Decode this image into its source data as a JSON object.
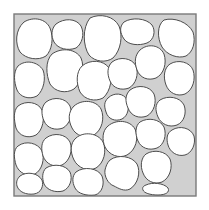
{
  "figure": {
    "type": "cell-packing-diagram",
    "colors": {
      "background": "#ffffff",
      "matrix_fill": "#d0d0d0",
      "frame_stroke": "#7a7a7a",
      "cell_fill": "#ffffff",
      "cell_stroke": "#4d4d4d"
    },
    "frame": {
      "x": 14,
      "y": 14,
      "width": 182,
      "height": 182
    },
    "cell_count": 30,
    "cells": [
      {
        "id": "c1",
        "d": "M24,22 C34,16 46,19 50,28 C54,38 52,50 46,56 C38,61 26,59 20,52 C15,44 15,30 24,22 Z"
      },
      {
        "id": "c2",
        "d": "M56,24 C64,18 76,18 81,26 C85,34 82,44 76,48 C68,51 58,49 54,42 C51,36 51,29 56,24 Z"
      },
      {
        "id": "c3",
        "d": "M90,18 C100,13 114,16 119,26 C123,36 121,50 113,58 C106,63 95,62 89,55 C83,46 82,28 90,18 Z"
      },
      {
        "id": "c4",
        "d": "M124,22 C132,17 146,18 152,25 C156,31 154,40 147,43 C139,46 128,45 124,39 C120,33 119,27 124,22 Z"
      },
      {
        "id": "c5",
        "d": "M164,20 C174,17 188,22 193,32 C196,42 193,52 186,56 C178,59 167,55 162,47 C157,38 157,25 164,20 Z"
      },
      {
        "id": "c6",
        "d": "M18,66 C26,59 38,62 43,70 C46,78 44,90 37,96 C29,100 20,97 17,90 C14,82 13,72 18,66 Z"
      },
      {
        "id": "c7",
        "d": "M52,54 C62,47 76,49 81,58 C85,67 82,82 74,89 C66,94 55,92 50,84 C46,75 45,61 52,54 Z"
      },
      {
        "id": "c8",
        "d": "M82,66 C90,59 104,60 109,68 C113,77 111,91 103,98 C95,102 85,100 80,92 C76,83 76,72 82,66 Z"
      },
      {
        "id": "c9",
        "d": "M112,62 C120,56 132,58 136,66 C139,74 136,84 129,88 C121,91 113,88 110,81 C107,74 107,67 112,62 Z"
      },
      {
        "id": "c10",
        "d": "M140,50 C148,43 160,45 164,54 C167,63 164,74 156,78 C148,81 140,78 137,70 C134,62 135,55 140,50 Z"
      },
      {
        "id": "c11",
        "d": "M170,64 C178,59 190,62 193,70 C196,79 193,90 185,94 C177,97 169,93 166,85 C163,77 164,68 170,64 Z"
      },
      {
        "id": "c12",
        "d": "M18,106 C26,100 38,102 42,110 C45,118 43,130 36,135 C28,139 19,136 16,128 C14,120 13,111 18,106 Z"
      },
      {
        "id": "c13",
        "d": "M46,102 C54,96 66,98 70,106 C73,114 70,124 63,128 C55,131 47,128 44,121 C41,114 41,107 46,102 Z"
      },
      {
        "id": "c14",
        "d": "M74,106 C82,99 96,100 101,109 C105,118 102,130 94,135 C86,139 76,136 72,128 C68,120 68,112 74,106 Z"
      },
      {
        "id": "c15",
        "d": "M108,98 C114,92 124,93 127,100 C130,107 128,116 122,119 C115,122 108,119 106,112 C104,106 104,102 108,98 Z"
      },
      {
        "id": "c16",
        "d": "M130,90 C138,84 150,86 154,94 C157,102 154,112 147,116 C139,119 131,116 128,108 C125,101 125,95 130,90 Z"
      },
      {
        "id": "c17",
        "d": "M160,100 C168,95 180,97 184,105 C187,113 184,122 177,125 C169,128 161,124 158,117 C155,110 155,104 160,100 Z"
      },
      {
        "id": "c18",
        "d": "M172,130 C180,125 191,128 194,136 C196,144 192,153 185,155 C177,157 170,152 168,145 C166,138 167,133 172,130 Z"
      },
      {
        "id": "c19",
        "d": "M18,146 C26,140 38,143 42,151 C45,159 42,170 35,174 C27,177 19,173 16,165 C14,158 13,150 18,146 Z"
      },
      {
        "id": "c20",
        "d": "M46,138 C54,132 66,134 70,142 C73,150 70,161 62,165 C54,168 46,164 43,156 C41,149 41,142 46,138 Z"
      },
      {
        "id": "c21",
        "d": "M76,138 C84,131 98,133 103,142 C107,151 104,163 96,168 C88,172 78,168 74,160 C70,152 70,143 76,138 Z"
      },
      {
        "id": "c22",
        "d": "M108,126 C116,119 130,120 135,129 C139,138 136,150 127,155 C119,159 109,155 105,147 C102,140 102,131 108,126 Z"
      },
      {
        "id": "c23",
        "d": "M140,122 C148,117 160,119 164,127 C167,135 164,145 157,148 C149,151 141,148 138,141 C135,134 135,126 140,122 Z"
      },
      {
        "id": "c24",
        "d": "M20,176 C27,171 38,173 42,180 C44,186 41,193 34,194 C26,195 19,192 17,186 C16,182 17,179 20,176 Z"
      },
      {
        "id": "c25",
        "d": "M46,168 C54,163 66,165 70,172 C73,179 70,188 63,191 C55,193 47,190 44,184 C42,178 42,172 46,168 Z"
      },
      {
        "id": "c26",
        "d": "M76,172 C84,166 98,168 102,176 C105,184 102,193 95,195 C87,196 78,194 75,188 C72,182 72,176 76,172 Z"
      },
      {
        "id": "c27",
        "d": "M110,160 C118,154 132,156 137,164 C141,172 138,184 130,189 C124,192 118,188 114,186 C108,184 104,176 105,170 C106,166 107,163 110,160 Z"
      },
      {
        "id": "c28",
        "d": "M146,154 C154,149 166,151 170,159 C173,167 170,178 162,182 C154,185 146,181 143,173 C140,166 141,158 146,154 Z"
      },
      {
        "id": "c29",
        "d": "M146,185 C152,182 164,183 168,188 C170,192 166,195 158,195 C150,195 144,193 143,190 C142,188 143,186 146,185 Z"
      },
      {
        "id": "c30",
        "d": "M112,28 C114,26 118,26 119,28 L119,30 C117,31 113,31 112,30 Z"
      }
    ]
  }
}
